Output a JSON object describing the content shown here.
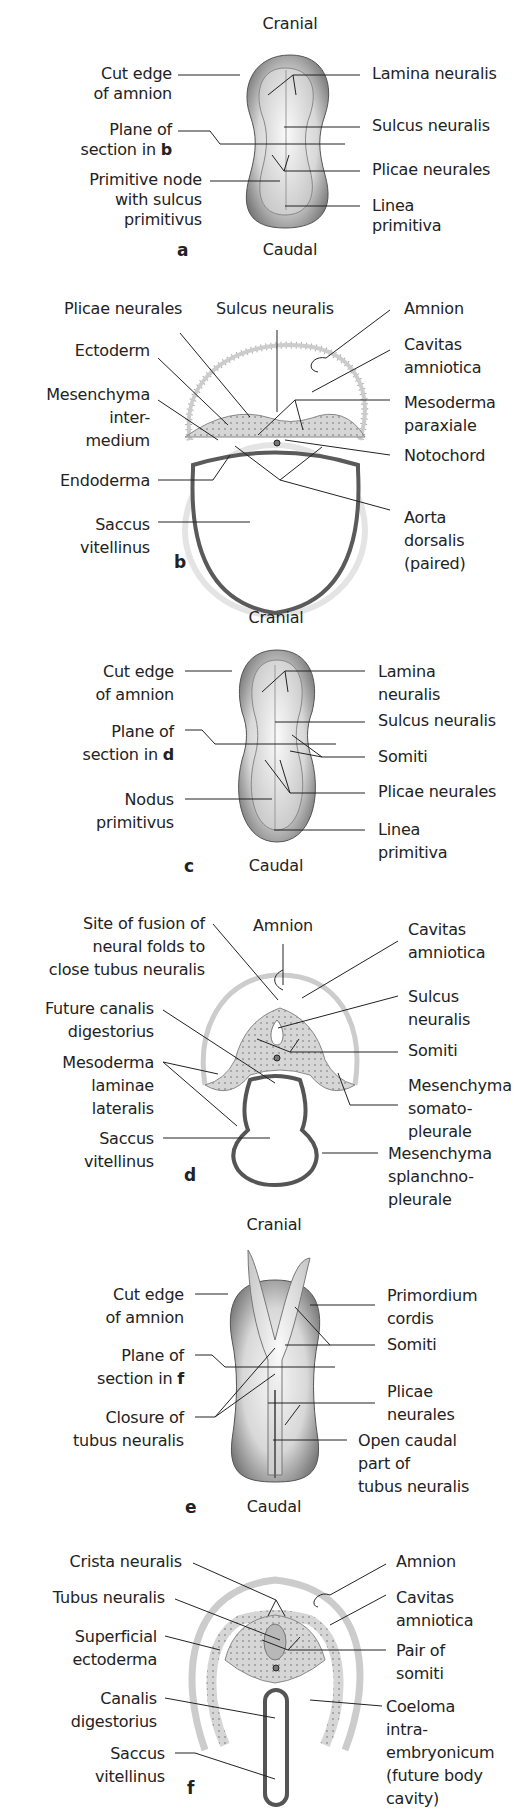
{
  "panels": {
    "a": {
      "letter": "a",
      "top": "Cranial",
      "bottom": "Caudal",
      "left": [
        "Cut edge\nof amnion",
        "Plane of\nsection in ",
        "Primitive node\nwith sulcus\nprimitivus"
      ],
      "plane_ref": "b",
      "right": [
        "Lamina neuralis",
        "Sulcus neuralis",
        "Plicae neurales",
        "Linea\nprimitiva"
      ]
    },
    "b": {
      "letter": "b",
      "top": [
        "Plicae neurales",
        "Sulcus neuralis",
        "Amnion"
      ],
      "left": [
        "Ectoderm",
        "Mesenchyma\ninter-\nmedium",
        "Endoderma",
        "Saccus\nvitellinus"
      ],
      "right": [
        "Cavitas\namniotica",
        "Mesoderma\nparaxiale",
        "Notochord",
        "Aorta\ndorsalis\n(paired)"
      ]
    },
    "c": {
      "letter": "c",
      "top": "Cranial",
      "bottom": "Caudal",
      "left": [
        "Cut edge\nof amnion",
        "Plane of\nsection in ",
        "Nodus\nprimitivus"
      ],
      "plane_ref": "d",
      "right": [
        "Lamina\nneuralis",
        "Sulcus neuralis",
        "Somiti",
        "Plicae neurales",
        "Linea\nprimitiva"
      ]
    },
    "d": {
      "letter": "d",
      "top": "Amnion",
      "left": [
        "Site of fusion of\nneural folds to\nclose tubus neuralis",
        "Future canalis\ndigestorius",
        "Mesoderma\nlaminae\nlateralis",
        "Saccus\nvitellinus"
      ],
      "right": [
        "Cavitas\namniotica",
        "Sulcus\nneuralis",
        "Somiti",
        "Mesenchyma\nsomato-\npleurale",
        "Mesenchyma\nsplanchno-\npleurale"
      ]
    },
    "e": {
      "letter": "e",
      "top": "Cranial",
      "bottom": "Caudal",
      "left": [
        "Cut edge\nof amnion",
        "Plane of\nsection in ",
        "Closure of\ntubus neuralis"
      ],
      "plane_ref": "f",
      "right": [
        "Primordium\ncordis",
        "Somiti",
        "Plicae\nneurales",
        "Open caudal\npart of\ntubus neuralis"
      ]
    },
    "f": {
      "letter": "f",
      "left": [
        "Crista neuralis",
        "Tubus neuralis",
        "Superficial\nectoderma",
        "Canalis\ndigestorius",
        "Saccus\nvitellinus"
      ],
      "right": [
        "Amnion",
        "Cavitas\namniotica",
        "Pair of\nsomiti",
        "Coeloma\nintra-\nembryonicum\n(future body\ncavity)"
      ]
    }
  },
  "colors": {
    "ink": "#222222",
    "tissue": "#c8c8c8",
    "tissue_light": "#e4e4e4",
    "endoderm": "#5a5a5a",
    "embryo_dark": "#6e6e6e",
    "embryo_light": "#eeeeee"
  }
}
